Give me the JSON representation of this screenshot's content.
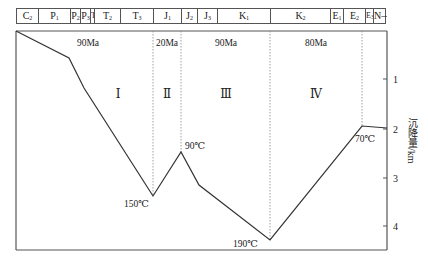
{
  "chart_data": {
    "type": "line",
    "title": "",
    "xlabel": "",
    "ylabel": "沉降量/km",
    "ylim": [
      0,
      4.5
    ],
    "y_ticks": [
      1,
      2,
      3,
      4
    ],
    "y_axis_side": "right",
    "y_inverted": true,
    "grid": false,
    "strata": [
      {
        "code": "C",
        "sub": "2",
        "x0": 16,
        "x1": 38
      },
      {
        "code": "P",
        "sub": "1",
        "x0": 38,
        "x1": 70
      },
      {
        "code": "P",
        "sub": "2",
        "x0": 70,
        "x1": 80
      },
      {
        "code": "P",
        "sub": "3",
        "x0": 80,
        "x1": 90
      },
      {
        "code": "T",
        "sub": "1",
        "x0": 90,
        "x1": 94
      },
      {
        "code": "T",
        "sub": "2",
        "x0": 94,
        "x1": 120
      },
      {
        "code": "T",
        "sub": "3",
        "x0": 120,
        "x1": 153
      },
      {
        "code": "J",
        "sub": "1",
        "x0": 153,
        "x1": 181
      },
      {
        "code": "J",
        "sub": "2",
        "x0": 181,
        "x1": 197
      },
      {
        "code": "J",
        "sub": "3",
        "x0": 197,
        "x1": 217
      },
      {
        "code": "K",
        "sub": "1",
        "x0": 217,
        "x1": 270
      },
      {
        "code": "K",
        "sub": "2",
        "x0": 270,
        "x1": 330
      },
      {
        "code": "E",
        "sub": "1",
        "x0": 330,
        "x1": 343
      },
      {
        "code": "E",
        "sub": "2",
        "x0": 343,
        "x1": 365
      },
      {
        "code": "E",
        "sub": "3",
        "x0": 365,
        "x1": 373
      },
      {
        "code": "N—Q",
        "sub": "",
        "x0": 373,
        "x1": 386
      }
    ],
    "series": [
      {
        "name": "burial depth",
        "points": [
          {
            "stratum": "C2 (start)",
            "depth_km": 0.0
          },
          {
            "stratum": "P1/P2",
            "depth_km": 0.55
          },
          {
            "stratum": "P3/T1",
            "depth_km": 1.15
          },
          {
            "stratum": "T3/J1",
            "depth_km": 3.4,
            "label": "150℃"
          },
          {
            "stratum": "J1/J2",
            "depth_km": 2.5,
            "label": "90℃"
          },
          {
            "stratum": "J2/J3",
            "depth_km": 3.15
          },
          {
            "stratum": "K1/K2",
            "depth_km": 4.3,
            "label": "190℃"
          },
          {
            "stratum": "E3",
            "depth_km": 1.4,
            "label": "70℃"
          },
          {
            "stratum": "N—Q (end)",
            "depth_km": 1.45
          }
        ]
      }
    ],
    "stages": [
      {
        "roman": "Ⅰ",
        "duration": "90Ma"
      },
      {
        "roman": "Ⅱ",
        "duration": "20Ma"
      },
      {
        "roman": "Ⅲ",
        "duration": "90Ma"
      },
      {
        "roman": "Ⅳ",
        "duration": "80Ma"
      }
    ],
    "annotations": [
      "150℃",
      "90℃",
      "190℃",
      "70℃"
    ]
  },
  "labels": {
    "ylabel": "沉降量/km",
    "ticks": [
      "1",
      "2",
      "3",
      "4"
    ],
    "durations": [
      "90Ma",
      "20Ma",
      "90Ma",
      "80Ma"
    ],
    "stages": [
      "Ⅰ",
      "Ⅱ",
      "Ⅲ",
      "Ⅳ"
    ],
    "temps": [
      "150℃",
      "90℃",
      "190℃",
      "70℃"
    ]
  },
  "colors": {
    "line": "#333333",
    "frame": "#555555",
    "dotted": "#888888"
  }
}
